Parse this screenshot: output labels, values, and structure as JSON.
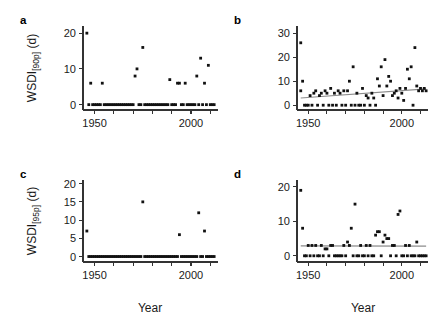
{
  "figure": {
    "background": "#ffffff",
    "point_color": "#111111",
    "trend_color": "#8c8c8c",
    "axis_color": "#333333",
    "xlabel": "Year"
  },
  "chart_data": [
    {
      "type": "scatter",
      "panel": "a",
      "title": "",
      "xlabel": "",
      "ylabel": "WSDI[90p] (d)",
      "ylabel_main": "WSDI",
      "ylabel_sub": "[90p]",
      "ylabel_unit": " (d)",
      "xlim": [
        1944,
        2014
      ],
      "ylim": [
        -1.5,
        22
      ],
      "yticks": [
        0,
        10,
        20
      ],
      "ytick_labels": [
        "0",
        "10",
        "20"
      ],
      "xticks": [
        1950,
        1960,
        1970,
        1980,
        1990,
        2000,
        2010
      ],
      "xtick_labels": [
        "1950",
        "",
        "",
        "",
        "",
        "2000",
        ""
      ],
      "xtick_labeled": [
        1950,
        2000
      ],
      "grid": false,
      "legend": false,
      "trendline": null,
      "x": [
        1946,
        1947,
        1948,
        1949,
        1950,
        1951,
        1952,
        1953,
        1954,
        1955,
        1956,
        1957,
        1958,
        1959,
        1960,
        1961,
        1962,
        1963,
        1964,
        1965,
        1966,
        1967,
        1968,
        1969,
        1970,
        1971,
        1972,
        1973,
        1974,
        1975,
        1976,
        1977,
        1978,
        1979,
        1980,
        1981,
        1982,
        1983,
        1984,
        1985,
        1986,
        1987,
        1988,
        1989,
        1990,
        1991,
        1992,
        1993,
        1994,
        1995,
        1996,
        1997,
        1998,
        1999,
        2000,
        2001,
        2002,
        2003,
        2004,
        2005,
        2006,
        2007,
        2008,
        2009,
        2010,
        2011,
        2012
      ],
      "y": [
        20,
        0,
        6,
        0,
        0,
        0,
        0,
        0,
        6,
        0,
        0,
        0,
        0,
        0,
        0,
        0,
        0,
        0,
        0,
        0,
        0,
        0,
        0,
        0,
        0,
        8,
        10,
        0,
        0,
        16,
        0,
        0,
        0,
        0,
        0,
        0,
        0,
        0,
        0,
        0,
        0,
        0,
        0,
        7,
        0,
        0,
        0,
        6,
        6,
        0,
        0,
        6,
        0,
        0,
        0,
        0,
        0,
        8,
        0,
        13,
        0,
        6,
        0,
        11,
        0,
        0,
        0
      ]
    },
    {
      "type": "scatter",
      "panel": "b",
      "title": "",
      "xlabel": "",
      "ylabel": "",
      "xlim": [
        1944,
        2014
      ],
      "ylim": [
        -2,
        33
      ],
      "yticks": [
        0,
        10,
        20,
        30
      ],
      "ytick_labels": [
        "0",
        "10",
        "20",
        "30"
      ],
      "xticks": [
        1950,
        1960,
        1970,
        1980,
        1990,
        2000,
        2010
      ],
      "xtick_labels": [
        "1950",
        "",
        "",
        "",
        "",
        "2000",
        ""
      ],
      "xtick_labeled": [
        1950,
        2000
      ],
      "grid": false,
      "legend": false,
      "trendline": {
        "x": [
          1946,
          2013
        ],
        "y": [
          3.0,
          6.8
        ]
      },
      "x": [
        1946,
        1946,
        1947,
        1948,
        1949,
        1950,
        1951,
        1952,
        1953,
        1954,
        1955,
        1956,
        1957,
        1958,
        1959,
        1960,
        1961,
        1962,
        1963,
        1964,
        1965,
        1966,
        1967,
        1968,
        1969,
        1970,
        1971,
        1972,
        1973,
        1974,
        1975,
        1976,
        1977,
        1978,
        1979,
        1980,
        1981,
        1982,
        1983,
        1984,
        1985,
        1986,
        1987,
        1988,
        1989,
        1990,
        1991,
        1992,
        1993,
        1994,
        1995,
        1996,
        1997,
        1998,
        1999,
        2000,
        2001,
        2002,
        2003,
        2004,
        2005,
        2006,
        2007,
        2008,
        2009,
        2010,
        2011,
        2012,
        2013
      ],
      "y": [
        26,
        6,
        10,
        0,
        0,
        0,
        4,
        0,
        5,
        6,
        0,
        4,
        5,
        0,
        6,
        5,
        0,
        7,
        0,
        5,
        0,
        6,
        5,
        0,
        6,
        0,
        6,
        10,
        0,
        16,
        0,
        5,
        0,
        0,
        7,
        0,
        4,
        3,
        0,
        5,
        3,
        0,
        11,
        8,
        16,
        4,
        19,
        8,
        12,
        10,
        4,
        5,
        6,
        3,
        7,
        5,
        2,
        7,
        15,
        11,
        16,
        0,
        24,
        8,
        6,
        7,
        6,
        7,
        6
      ]
    },
    {
      "type": "scatter",
      "panel": "c",
      "title": "",
      "xlabel": "Year",
      "ylabel": "WSDI[95p] (d)",
      "ylabel_main": "WSDI",
      "ylabel_sub": "[95p]",
      "ylabel_unit": " (d)",
      "xlim": [
        1944,
        2014
      ],
      "ylim": [
        -1.5,
        21
      ],
      "yticks": [
        0,
        5,
        10,
        15,
        20
      ],
      "ytick_labels": [
        "0",
        "5",
        "10",
        "15",
        "20"
      ],
      "xticks": [
        1950,
        1960,
        1970,
        1980,
        1990,
        2000,
        2010
      ],
      "xtick_labels": [
        "1950",
        "",
        "",
        "",
        "",
        "2000",
        ""
      ],
      "xtick_labeled": [
        1950,
        2000
      ],
      "grid": false,
      "legend": false,
      "trendline": null,
      "x": [
        1946,
        1947,
        1948,
        1949,
        1950,
        1951,
        1952,
        1953,
        1954,
        1955,
        1956,
        1957,
        1958,
        1959,
        1960,
        1961,
        1962,
        1963,
        1964,
        1965,
        1966,
        1967,
        1968,
        1969,
        1970,
        1971,
        1972,
        1973,
        1974,
        1975,
        1976,
        1977,
        1978,
        1979,
        1980,
        1981,
        1982,
        1983,
        1984,
        1985,
        1986,
        1987,
        1988,
        1989,
        1990,
        1991,
        1992,
        1993,
        1994,
        1995,
        1996,
        1997,
        1998,
        1999,
        2000,
        2001,
        2002,
        2003,
        2004,
        2005,
        2006,
        2007,
        2008,
        2009,
        2010,
        2011,
        2012
      ],
      "y": [
        7,
        0,
        0,
        0,
        0,
        0,
        0,
        0,
        0,
        0,
        0,
        0,
        0,
        0,
        0,
        0,
        0,
        0,
        0,
        0,
        0,
        0,
        0,
        0,
        0,
        0,
        0,
        0,
        0,
        15,
        0,
        0,
        0,
        0,
        0,
        0,
        0,
        0,
        0,
        0,
        0,
        0,
        0,
        0,
        0,
        0,
        0,
        0,
        6,
        0,
        0,
        0,
        0,
        0,
        0,
        0,
        0,
        0,
        12,
        0,
        0,
        7,
        0,
        0,
        0,
        0,
        0
      ]
    },
    {
      "type": "scatter",
      "panel": "d",
      "title": "",
      "xlabel": "Year",
      "ylabel": "",
      "xlim": [
        1944,
        2014
      ],
      "ylim": [
        -1.8,
        22
      ],
      "yticks": [
        0,
        10,
        20
      ],
      "ytick_labels": [
        "0",
        "10",
        "20"
      ],
      "xticks": [
        1950,
        1960,
        1970,
        1980,
        1990,
        2000,
        2010
      ],
      "xtick_labels": [
        "1950",
        "",
        "",
        "",
        "",
        "2000",
        ""
      ],
      "xtick_labeled": [
        1950,
        2000
      ],
      "grid": false,
      "legend": false,
      "trendline": {
        "x": [
          1946,
          2013
        ],
        "y": [
          2.9,
          2.8
        ]
      },
      "x": [
        1946,
        1947,
        1948,
        1949,
        1950,
        1951,
        1952,
        1953,
        1954,
        1955,
        1956,
        1957,
        1958,
        1959,
        1960,
        1961,
        1962,
        1963,
        1964,
        1965,
        1966,
        1967,
        1968,
        1969,
        1970,
        1971,
        1972,
        1973,
        1974,
        1975,
        1976,
        1977,
        1978,
        1979,
        1980,
        1981,
        1982,
        1983,
        1984,
        1985,
        1986,
        1987,
        1988,
        1989,
        1990,
        1991,
        1992,
        1993,
        1994,
        1995,
        1996,
        1997,
        1998,
        1999,
        2000,
        2001,
        2002,
        2003,
        2004,
        2005,
        2006,
        2007,
        2008,
        2009,
        2010,
        2011,
        2012,
        2013
      ],
      "y": [
        19,
        8,
        0,
        0,
        3,
        0,
        3,
        0,
        3,
        0,
        0,
        3,
        0,
        2,
        2,
        0,
        3,
        3,
        0,
        0,
        0,
        0,
        0,
        3,
        0,
        4,
        3,
        8,
        0,
        15,
        0,
        0,
        3,
        0,
        0,
        3,
        0,
        3,
        0,
        0,
        6,
        7,
        7,
        0,
        4,
        6,
        5,
        5,
        0,
        3,
        3,
        0,
        12,
        13,
        0,
        0,
        3,
        0,
        3,
        0,
        0,
        0,
        4,
        0,
        0,
        0,
        0,
        0
      ]
    }
  ],
  "panels": [
    {
      "letter": "a"
    },
    {
      "letter": "b"
    },
    {
      "letter": "c"
    },
    {
      "letter": "d"
    }
  ]
}
